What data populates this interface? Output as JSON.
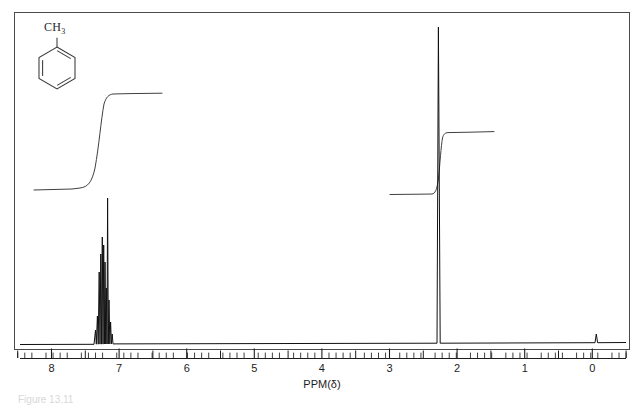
{
  "figure": {
    "caption": "Figure 13.11",
    "compound_name": "toluene",
    "structure_label": "CH3",
    "structure_label_main": "CH",
    "structure_label_sub": "3"
  },
  "chart_data": {
    "type": "line",
    "title": "",
    "xlabel": "PPM(δ)",
    "ylabel": "",
    "xlim": [
      8.3,
      -0.3
    ],
    "axis_direction": "reversed",
    "grid": false,
    "legend": false,
    "tick_labels": [
      "8",
      "7",
      "6",
      "5",
      "4",
      "3",
      "2",
      "1",
      "0"
    ],
    "tick_values": [
      8,
      7,
      6,
      5,
      4,
      3,
      2,
      1,
      0
    ],
    "minor_ticks_per_unit": 10,
    "baseline_ppm_range": [
      8.3,
      -0.3
    ],
    "peaks": [
      {
        "name": "aromatic-multiplet-a",
        "ppm": 7.28,
        "height": 0.37,
        "width": 0.012
      },
      {
        "name": "aromatic-multiplet-b",
        "ppm": 7.26,
        "height": 0.3,
        "width": 0.012
      },
      {
        "name": "aromatic-multiplet-c",
        "ppm": 7.24,
        "height": 0.26,
        "width": 0.012
      },
      {
        "name": "aromatic-multiplet-d",
        "ppm": 7.22,
        "height": 0.45,
        "width": 0.012
      },
      {
        "name": "aromatic-multiplet-e",
        "ppm": 7.2,
        "height": 0.33,
        "width": 0.012
      },
      {
        "name": "aromatic-multiplet-f",
        "ppm": 7.18,
        "height": 0.28,
        "width": 0.012
      },
      {
        "name": "aromatic-multiplet-g",
        "ppm": 7.17,
        "height": 0.22,
        "width": 0.012
      },
      {
        "name": "aromatic-tall-line",
        "ppm": 7.14,
        "height": 0.46,
        "width": 0.01
      },
      {
        "name": "aromatic-multiplet-h",
        "ppm": 7.12,
        "height": 0.2,
        "width": 0.012
      },
      {
        "name": "aromatic-multiplet-i",
        "ppm": 7.1,
        "height": 0.14,
        "width": 0.012
      },
      {
        "name": "methyl-singlet",
        "ppm": 2.32,
        "height": 0.96,
        "width": 0.012
      },
      {
        "name": "tms-reference",
        "ppm": 0.0,
        "height": 0.05,
        "width": 0.014
      }
    ],
    "integration_steps": [
      {
        "name": "aromatic-integration",
        "start_ppm": 8.05,
        "end_ppm": 6.35,
        "rise_start_ppm": 7.4,
        "rise_end_ppm": 7.06,
        "base_level": 0.525,
        "top_level": 0.81,
        "relative_protons": 5
      },
      {
        "name": "methyl-integration",
        "start_ppm": 3.02,
        "end_ppm": 1.55,
        "rise_start_ppm": 2.4,
        "rise_end_ppm": 2.27,
        "base_level": 0.512,
        "top_level": 0.69,
        "relative_protons": 3
      }
    ],
    "annotations": [
      {
        "name": "structure-toluene",
        "text": "CH3",
        "ppm": 7.75,
        "level": 0.93
      }
    ]
  },
  "structure": {
    "ring_type": "benzene-kekule-hexagon",
    "substituent": "methyl"
  }
}
